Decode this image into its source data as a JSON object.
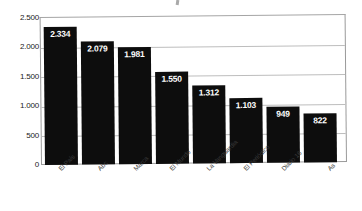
{
  "chart_data": {
    "type": "bar",
    "title": "",
    "xlabel": "",
    "ylabel": "",
    "ylim": [
      0,
      2500
    ],
    "ytick_labels": [
      "2.500",
      "2.000",
      "1.500",
      "1.000",
      "500",
      "0"
    ],
    "ytick_values": [
      2500,
      2000,
      1500,
      1000,
      500,
      0
    ],
    "grid": true,
    "legend": "none",
    "categories": [
      "El País",
      "Abc",
      "Marca",
      "El Mundo",
      "La Vanguardia",
      "El Periódico",
      "Diario 16",
      "As"
    ],
    "values": [
      2334,
      2079,
      1981,
      1550,
      1312,
      1103,
      949,
      822
    ],
    "value_labels": [
      "2.334",
      "2.079",
      "1.981",
      "1.550",
      "1.312",
      "1.103",
      "949",
      "822"
    ],
    "bar_color": "#0d0d0d",
    "label_color": "#ffffff",
    "grid_color": "#bdbdbd",
    "axis_color": "#9a9a9a"
  }
}
